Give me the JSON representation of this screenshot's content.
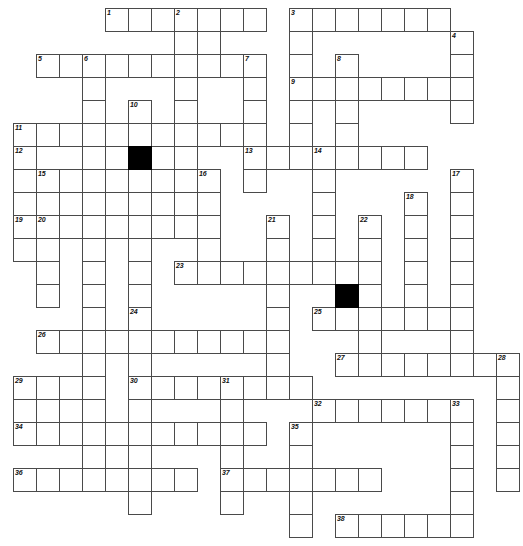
{
  "puzzle": {
    "title": "Crossword Grid",
    "type": "freeform-crossword",
    "grid": {
      "columns": 22,
      "rows": 23,
      "cell_size": 23,
      "origin_x": 13,
      "origin_y": 8,
      "line_color": "#4a4a4a",
      "block_color": "#000000",
      "background_color": "#ffffff"
    },
    "block_cells": [
      {
        "col": 5,
        "row": 6
      },
      {
        "col": 14,
        "row": 12
      }
    ],
    "numbers": [
      {
        "n": "1",
        "col": 4,
        "row": 0
      },
      {
        "n": "2",
        "col": 7,
        "row": 0
      },
      {
        "n": "3",
        "col": 12,
        "row": 0
      },
      {
        "n": "4",
        "col": 19,
        "row": 1
      },
      {
        "n": "5",
        "col": 1,
        "row": 2
      },
      {
        "n": "6",
        "col": 3,
        "row": 2
      },
      {
        "n": "7",
        "col": 10,
        "row": 2
      },
      {
        "n": "8",
        "col": 14,
        "row": 2
      },
      {
        "n": "9",
        "col": 12,
        "row": 3
      },
      {
        "n": "10",
        "col": 5,
        "row": 4
      },
      {
        "n": "11",
        "col": 0,
        "row": 5
      },
      {
        "n": "12",
        "col": 0,
        "row": 6
      },
      {
        "n": "13",
        "col": 10,
        "row": 6
      },
      {
        "n": "14",
        "col": 13,
        "row": 6
      },
      {
        "n": "15",
        "col": 1,
        "row": 7
      },
      {
        "n": "16",
        "col": 8,
        "row": 7
      },
      {
        "n": "17",
        "col": 19,
        "row": 7
      },
      {
        "n": "18",
        "col": 17,
        "row": 8
      },
      {
        "n": "19",
        "col": 0,
        "row": 9
      },
      {
        "n": "20",
        "col": 1,
        "row": 9
      },
      {
        "n": "21",
        "col": 11,
        "row": 9
      },
      {
        "n": "22",
        "col": 15,
        "row": 9
      },
      {
        "n": "23",
        "col": 7,
        "row": 11
      },
      {
        "n": "24",
        "col": 5,
        "row": 13
      },
      {
        "n": "25",
        "col": 13,
        "row": 13
      },
      {
        "n": "26",
        "col": 1,
        "row": 14
      },
      {
        "n": "27",
        "col": 14,
        "row": 15
      },
      {
        "n": "28",
        "col": 21,
        "row": 15
      },
      {
        "n": "29",
        "col": 0,
        "row": 16
      },
      {
        "n": "30",
        "col": 5,
        "row": 16
      },
      {
        "n": "31",
        "col": 9,
        "row": 16
      },
      {
        "n": "32",
        "col": 13,
        "row": 17
      },
      {
        "n": "33",
        "col": 19,
        "row": 17
      },
      {
        "n": "34",
        "col": 0,
        "row": 18
      },
      {
        "n": "35",
        "col": 12,
        "row": 18
      },
      {
        "n": "36",
        "col": 0,
        "row": 20
      },
      {
        "n": "37",
        "col": 9,
        "row": 20
      },
      {
        "n": "38",
        "col": 14,
        "row": 22
      }
    ],
    "cells": [
      {
        "col": 4,
        "row": 0
      },
      {
        "col": 5,
        "row": 0
      },
      {
        "col": 6,
        "row": 0
      },
      {
        "col": 7,
        "row": 0
      },
      {
        "col": 8,
        "row": 0
      },
      {
        "col": 9,
        "row": 0
      },
      {
        "col": 10,
        "row": 0
      },
      {
        "col": 12,
        "row": 0
      },
      {
        "col": 13,
        "row": 0
      },
      {
        "col": 14,
        "row": 0
      },
      {
        "col": 15,
        "row": 0
      },
      {
        "col": 16,
        "row": 0
      },
      {
        "col": 17,
        "row": 0
      },
      {
        "col": 18,
        "row": 0
      },
      {
        "col": 7,
        "row": 1
      },
      {
        "col": 8,
        "row": 1
      },
      {
        "col": 12,
        "row": 1
      },
      {
        "col": 19,
        "row": 1
      },
      {
        "col": 1,
        "row": 2
      },
      {
        "col": 2,
        "row": 2
      },
      {
        "col": 3,
        "row": 2
      },
      {
        "col": 4,
        "row": 2
      },
      {
        "col": 5,
        "row": 2
      },
      {
        "col": 6,
        "row": 2
      },
      {
        "col": 7,
        "row": 2
      },
      {
        "col": 8,
        "row": 2
      },
      {
        "col": 9,
        "row": 2
      },
      {
        "col": 10,
        "row": 2
      },
      {
        "col": 12,
        "row": 2
      },
      {
        "col": 14,
        "row": 2
      },
      {
        "col": 19,
        "row": 2
      },
      {
        "col": 3,
        "row": 3
      },
      {
        "col": 7,
        "row": 3
      },
      {
        "col": 10,
        "row": 3
      },
      {
        "col": 12,
        "row": 3
      },
      {
        "col": 13,
        "row": 3
      },
      {
        "col": 14,
        "row": 3
      },
      {
        "col": 15,
        "row": 3
      },
      {
        "col": 16,
        "row": 3
      },
      {
        "col": 17,
        "row": 3
      },
      {
        "col": 18,
        "row": 3
      },
      {
        "col": 19,
        "row": 3
      },
      {
        "col": 3,
        "row": 4
      },
      {
        "col": 5,
        "row": 4
      },
      {
        "col": 7,
        "row": 4
      },
      {
        "col": 10,
        "row": 4
      },
      {
        "col": 12,
        "row": 4
      },
      {
        "col": 14,
        "row": 4
      },
      {
        "col": 19,
        "row": 4
      },
      {
        "col": 0,
        "row": 5
      },
      {
        "col": 1,
        "row": 5
      },
      {
        "col": 2,
        "row": 5
      },
      {
        "col": 3,
        "row": 5
      },
      {
        "col": 4,
        "row": 5
      },
      {
        "col": 5,
        "row": 5
      },
      {
        "col": 6,
        "row": 5
      },
      {
        "col": 7,
        "row": 5
      },
      {
        "col": 8,
        "row": 5
      },
      {
        "col": 9,
        "row": 5
      },
      {
        "col": 10,
        "row": 5
      },
      {
        "col": 12,
        "row": 5
      },
      {
        "col": 14,
        "row": 5
      },
      {
        "col": 0,
        "row": 6
      },
      {
        "col": 3,
        "row": 6
      },
      {
        "col": 5,
        "row": 6
      },
      {
        "col": 7,
        "row": 6
      },
      {
        "col": 10,
        "row": 6
      },
      {
        "col": 11,
        "row": 6
      },
      {
        "col": 12,
        "row": 6
      },
      {
        "col": 13,
        "row": 6
      },
      {
        "col": 14,
        "row": 6
      },
      {
        "col": 15,
        "row": 6
      },
      {
        "col": 16,
        "row": 6
      },
      {
        "col": 17,
        "row": 6
      },
      {
        "col": 0,
        "row": 7
      },
      {
        "col": 1,
        "row": 7
      },
      {
        "col": 2,
        "row": 7
      },
      {
        "col": 3,
        "row": 7
      },
      {
        "col": 4,
        "row": 7
      },
      {
        "col": 5,
        "row": 7
      },
      {
        "col": 6,
        "row": 7
      },
      {
        "col": 7,
        "row": 7
      },
      {
        "col": 8,
        "row": 7
      },
      {
        "col": 10,
        "row": 7
      },
      {
        "col": 13,
        "row": 7
      },
      {
        "col": 19,
        "row": 7
      },
      {
        "col": 0,
        "row": 8
      },
      {
        "col": 1,
        "row": 8
      },
      {
        "col": 3,
        "row": 8
      },
      {
        "col": 5,
        "row": 8
      },
      {
        "col": 7,
        "row": 8
      },
      {
        "col": 8,
        "row": 8
      },
      {
        "col": 13,
        "row": 8
      },
      {
        "col": 17,
        "row": 8
      },
      {
        "col": 19,
        "row": 8
      },
      {
        "col": 0,
        "row": 9
      },
      {
        "col": 1,
        "row": 9
      },
      {
        "col": 2,
        "row": 9
      },
      {
        "col": 3,
        "row": 9
      },
      {
        "col": 4,
        "row": 9
      },
      {
        "col": 5,
        "row": 9
      },
      {
        "col": 6,
        "row": 9
      },
      {
        "col": 7,
        "row": 9
      },
      {
        "col": 8,
        "row": 9
      },
      {
        "col": 11,
        "row": 9
      },
      {
        "col": 13,
        "row": 9
      },
      {
        "col": 15,
        "row": 9
      },
      {
        "col": 17,
        "row": 9
      },
      {
        "col": 19,
        "row": 9
      },
      {
        "col": 0,
        "row": 10
      },
      {
        "col": 1,
        "row": 10
      },
      {
        "col": 3,
        "row": 10
      },
      {
        "col": 5,
        "row": 10
      },
      {
        "col": 8,
        "row": 10
      },
      {
        "col": 11,
        "row": 10
      },
      {
        "col": 13,
        "row": 10
      },
      {
        "col": 15,
        "row": 10
      },
      {
        "col": 17,
        "row": 10
      },
      {
        "col": 19,
        "row": 10
      },
      {
        "col": 1,
        "row": 11
      },
      {
        "col": 3,
        "row": 11
      },
      {
        "col": 5,
        "row": 11
      },
      {
        "col": 7,
        "row": 11
      },
      {
        "col": 8,
        "row": 11
      },
      {
        "col": 9,
        "row": 11
      },
      {
        "col": 10,
        "row": 11
      },
      {
        "col": 11,
        "row": 11
      },
      {
        "col": 12,
        "row": 11
      },
      {
        "col": 13,
        "row": 11
      },
      {
        "col": 14,
        "row": 11
      },
      {
        "col": 15,
        "row": 11
      },
      {
        "col": 17,
        "row": 11
      },
      {
        "col": 19,
        "row": 11
      },
      {
        "col": 1,
        "row": 12
      },
      {
        "col": 3,
        "row": 12
      },
      {
        "col": 5,
        "row": 12
      },
      {
        "col": 11,
        "row": 12
      },
      {
        "col": 14,
        "row": 12
      },
      {
        "col": 15,
        "row": 12
      },
      {
        "col": 17,
        "row": 12
      },
      {
        "col": 19,
        "row": 12
      },
      {
        "col": 3,
        "row": 13
      },
      {
        "col": 5,
        "row": 13
      },
      {
        "col": 11,
        "row": 13
      },
      {
        "col": 13,
        "row": 13
      },
      {
        "col": 14,
        "row": 13
      },
      {
        "col": 15,
        "row": 13
      },
      {
        "col": 16,
        "row": 13
      },
      {
        "col": 17,
        "row": 13
      },
      {
        "col": 18,
        "row": 13
      },
      {
        "col": 19,
        "row": 13
      },
      {
        "col": 1,
        "row": 14
      },
      {
        "col": 2,
        "row": 14
      },
      {
        "col": 3,
        "row": 14
      },
      {
        "col": 4,
        "row": 14
      },
      {
        "col": 5,
        "row": 14
      },
      {
        "col": 6,
        "row": 14
      },
      {
        "col": 7,
        "row": 14
      },
      {
        "col": 8,
        "row": 14
      },
      {
        "col": 9,
        "row": 14
      },
      {
        "col": 10,
        "row": 14
      },
      {
        "col": 11,
        "row": 14
      },
      {
        "col": 15,
        "row": 14
      },
      {
        "col": 19,
        "row": 14
      },
      {
        "col": 3,
        "row": 15
      },
      {
        "col": 5,
        "row": 15
      },
      {
        "col": 11,
        "row": 15
      },
      {
        "col": 14,
        "row": 15
      },
      {
        "col": 15,
        "row": 15
      },
      {
        "col": 16,
        "row": 15
      },
      {
        "col": 17,
        "row": 15
      },
      {
        "col": 18,
        "row": 15
      },
      {
        "col": 19,
        "row": 15
      },
      {
        "col": 20,
        "row": 15
      },
      {
        "col": 21,
        "row": 15
      },
      {
        "col": 0,
        "row": 16
      },
      {
        "col": 1,
        "row": 16
      },
      {
        "col": 2,
        "row": 16
      },
      {
        "col": 3,
        "row": 16
      },
      {
        "col": 5,
        "row": 16
      },
      {
        "col": 6,
        "row": 16
      },
      {
        "col": 7,
        "row": 16
      },
      {
        "col": 8,
        "row": 16
      },
      {
        "col": 9,
        "row": 16
      },
      {
        "col": 10,
        "row": 16
      },
      {
        "col": 11,
        "row": 16
      },
      {
        "col": 12,
        "row": 16
      },
      {
        "col": 21,
        "row": 16
      },
      {
        "col": 0,
        "row": 17
      },
      {
        "col": 1,
        "row": 17
      },
      {
        "col": 2,
        "row": 17
      },
      {
        "col": 3,
        "row": 17
      },
      {
        "col": 5,
        "row": 17
      },
      {
        "col": 9,
        "row": 17
      },
      {
        "col": 13,
        "row": 17
      },
      {
        "col": 14,
        "row": 17
      },
      {
        "col": 15,
        "row": 17
      },
      {
        "col": 16,
        "row": 17
      },
      {
        "col": 17,
        "row": 17
      },
      {
        "col": 18,
        "row": 17
      },
      {
        "col": 19,
        "row": 17
      },
      {
        "col": 21,
        "row": 17
      },
      {
        "col": 0,
        "row": 18
      },
      {
        "col": 1,
        "row": 18
      },
      {
        "col": 2,
        "row": 18
      },
      {
        "col": 3,
        "row": 18
      },
      {
        "col": 4,
        "row": 18
      },
      {
        "col": 5,
        "row": 18
      },
      {
        "col": 6,
        "row": 18
      },
      {
        "col": 7,
        "row": 18
      },
      {
        "col": 8,
        "row": 18
      },
      {
        "col": 9,
        "row": 18
      },
      {
        "col": 10,
        "row": 18
      },
      {
        "col": 12,
        "row": 18
      },
      {
        "col": 19,
        "row": 18
      },
      {
        "col": 21,
        "row": 18
      },
      {
        "col": 3,
        "row": 19
      },
      {
        "col": 5,
        "row": 19
      },
      {
        "col": 9,
        "row": 19
      },
      {
        "col": 12,
        "row": 19
      },
      {
        "col": 19,
        "row": 19
      },
      {
        "col": 21,
        "row": 19
      },
      {
        "col": 0,
        "row": 20
      },
      {
        "col": 1,
        "row": 20
      },
      {
        "col": 2,
        "row": 20
      },
      {
        "col": 3,
        "row": 20
      },
      {
        "col": 4,
        "row": 20
      },
      {
        "col": 5,
        "row": 20
      },
      {
        "col": 6,
        "row": 20
      },
      {
        "col": 7,
        "row": 20
      },
      {
        "col": 9,
        "row": 20
      },
      {
        "col": 10,
        "row": 20
      },
      {
        "col": 11,
        "row": 20
      },
      {
        "col": 12,
        "row": 20
      },
      {
        "col": 13,
        "row": 20
      },
      {
        "col": 14,
        "row": 20
      },
      {
        "col": 15,
        "row": 20
      },
      {
        "col": 19,
        "row": 20
      },
      {
        "col": 21,
        "row": 20
      },
      {
        "col": 5,
        "row": 21
      },
      {
        "col": 9,
        "row": 21
      },
      {
        "col": 12,
        "row": 21
      },
      {
        "col": 19,
        "row": 21
      },
      {
        "col": 12,
        "row": 22
      },
      {
        "col": 14,
        "row": 22
      },
      {
        "col": 15,
        "row": 22
      },
      {
        "col": 16,
        "row": 22
      },
      {
        "col": 17,
        "row": 22
      },
      {
        "col": 18,
        "row": 22
      },
      {
        "col": 19,
        "row": 22
      }
    ]
  }
}
